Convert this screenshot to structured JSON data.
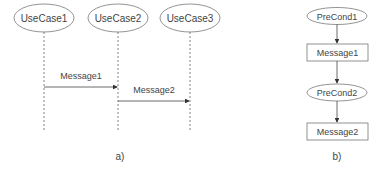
{
  "diagram_a": {
    "caption": "a)",
    "lifelines": [
      {
        "label": "UseCase1",
        "cx": 44
      },
      {
        "label": "UseCase2",
        "cx": 118
      },
      {
        "label": "UseCase3",
        "cx": 190
      }
    ],
    "messages": [
      {
        "label": "Message1",
        "from": 0,
        "to": 1,
        "y": 87
      },
      {
        "label": "Message2",
        "from": 1,
        "to": 2,
        "y": 101
      }
    ]
  },
  "diagram_b": {
    "caption": "b)",
    "nodes": [
      {
        "type": "precondition",
        "label": "PreCond1"
      },
      {
        "type": "message",
        "label": "Message1"
      },
      {
        "type": "precondition",
        "label": "PreCond2"
      },
      {
        "type": "message",
        "label": "Message2"
      }
    ]
  },
  "colors": {
    "stroke": "#555555",
    "text": "#444444"
  }
}
